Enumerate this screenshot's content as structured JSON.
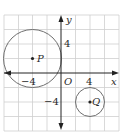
{
  "diagram": {
    "type": "coordinate-plane",
    "axes": {
      "x_label": "x",
      "y_label": "y",
      "origin_label": "O"
    },
    "tick_labels": {
      "x_neg": "−4",
      "x_pos": "4",
      "y_pos": "4",
      "y_neg": "−4"
    },
    "grid": {
      "unit_per_cell": 2,
      "x_range": [
        -8,
        8
      ],
      "y_range": [
        -8,
        8
      ]
    },
    "circles": [
      {
        "name": "P",
        "center": [
          -4,
          2
        ],
        "radius": 4,
        "label": "P"
      },
      {
        "name": "Q",
        "center": [
          4,
          -4
        ],
        "radius": 2,
        "label": "Q"
      }
    ],
    "colors": {
      "grid": "#cfcfcf",
      "axis": "#222222",
      "circle": "#6f6f6f"
    }
  }
}
